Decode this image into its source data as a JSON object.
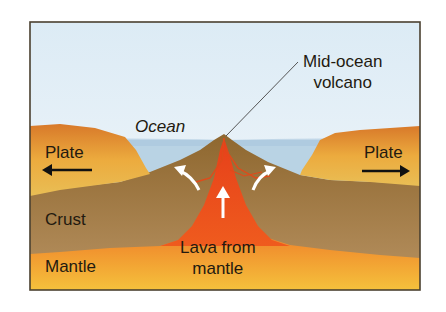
{
  "diagram": {
    "labels": {
      "volcano_line1": "Mid-ocean",
      "volcano_line2": "volcano",
      "ocean": "Ocean",
      "plate_left": "Plate",
      "plate_right": "Plate",
      "crust": "Crust",
      "mantle": "Mantle",
      "lava_line1": "Lava from",
      "lava_line2": "mantle"
    },
    "arrows": [
      {
        "name": "plate-left-arrow",
        "direction": "left",
        "color": "#111111"
      },
      {
        "name": "plate-right-arrow",
        "direction": "right",
        "color": "#111111"
      },
      {
        "name": "lava-up-arrow",
        "direction": "up",
        "color": "#ffffff"
      },
      {
        "name": "left-curved-arrow",
        "direction": "up-left",
        "color": "#ffffff"
      },
      {
        "name": "right-curved-arrow",
        "direction": "up-right",
        "color": "#ffffff"
      }
    ],
    "colors": {
      "sky": "#e6f1f8",
      "ocean": "#b9d3e4",
      "plate": "#e7a23a",
      "crust": "#a07a45",
      "mantle_top": "#ea5a1f",
      "mantle_bottom": "#f3b437",
      "lava": "#ec4a1c",
      "frame": "#4a4030"
    }
  }
}
